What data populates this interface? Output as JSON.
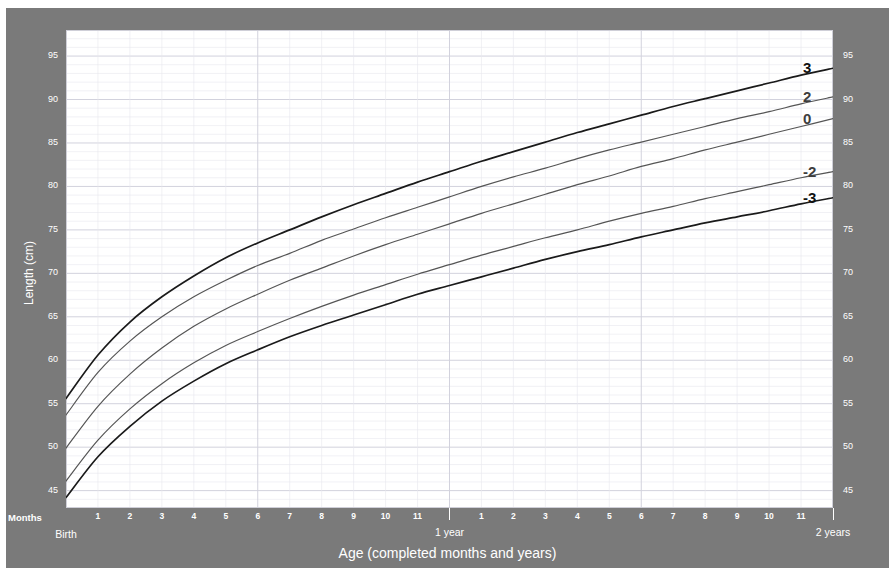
{
  "chart_data": {
    "type": "line",
    "title": "",
    "xlabel": "Age (completed months and years)",
    "ylabel": "Length (cm)",
    "xlim": [
      0,
      24
    ],
    "ylim": [
      43,
      98
    ],
    "grid": true,
    "legend_position": "right-inline",
    "x_unit": "months",
    "x": [
      0,
      1,
      2,
      3,
      4,
      5,
      6,
      7,
      8,
      9,
      10,
      11,
      12,
      13,
      14,
      15,
      16,
      17,
      18,
      19,
      20,
      21,
      22,
      23,
      24
    ],
    "series": [
      {
        "name": "3",
        "label": "3",
        "color": "#1a1a1a",
        "values": [
          55.6,
          60.6,
          64.4,
          67.3,
          69.7,
          71.8,
          73.5,
          75.0,
          76.5,
          77.9,
          79.2,
          80.5,
          81.7,
          82.9,
          84.0,
          85.1,
          86.2,
          87.2,
          88.2,
          89.2,
          90.1,
          91.0,
          91.9,
          92.8,
          93.6
        ]
      },
      {
        "name": "2",
        "label": "2",
        "color": "#555555",
        "values": [
          53.7,
          58.6,
          62.2,
          65.0,
          67.3,
          69.2,
          70.9,
          72.3,
          73.8,
          75.1,
          76.4,
          77.6,
          78.8,
          80.0,
          81.1,
          82.1,
          83.2,
          84.2,
          85.1,
          86.0,
          86.9,
          87.8,
          88.6,
          89.5,
          90.3
        ]
      },
      {
        "name": "0",
        "label": "0",
        "color": "#555555",
        "values": [
          49.9,
          54.7,
          58.4,
          61.4,
          63.9,
          65.9,
          67.6,
          69.2,
          70.6,
          72.0,
          73.3,
          74.5,
          75.7,
          76.9,
          78.0,
          79.1,
          80.2,
          81.2,
          82.3,
          83.2,
          84.2,
          85.1,
          86.0,
          86.9,
          87.8
        ]
      },
      {
        "name": "-2",
        "label": "-2",
        "color": "#555555",
        "values": [
          46.1,
          50.8,
          54.4,
          57.3,
          59.7,
          61.7,
          63.3,
          64.8,
          66.2,
          67.5,
          68.7,
          69.9,
          71.0,
          72.1,
          73.1,
          74.1,
          75.0,
          76.0,
          76.9,
          77.7,
          78.6,
          79.4,
          80.2,
          81.0,
          81.7
        ]
      },
      {
        "name": "-3",
        "label": "-3",
        "color": "#1a1a1a",
        "values": [
          44.2,
          48.9,
          52.4,
          55.3,
          57.6,
          59.6,
          61.2,
          62.7,
          64.0,
          65.2,
          66.4,
          67.6,
          68.6,
          69.6,
          70.6,
          71.6,
          72.5,
          73.3,
          74.2,
          75.0,
          75.8,
          76.5,
          77.2,
          78.0,
          78.7
        ]
      }
    ],
    "y_ticks": [
      45,
      50,
      55,
      60,
      65,
      70,
      75,
      80,
      85,
      90,
      95
    ],
    "y_minor_step": 1,
    "x_ticks_months": [
      1,
      2,
      3,
      4,
      5,
      6,
      7,
      8,
      9,
      10,
      11,
      13,
      14,
      15,
      16,
      17,
      18,
      19,
      20,
      21,
      22,
      23
    ],
    "x_tick_labels": [
      "1",
      "2",
      "3",
      "4",
      "5",
      "6",
      "7",
      "8",
      "9",
      "10",
      "11",
      "1",
      "2",
      "3",
      "4",
      "5",
      "6",
      "7",
      "8",
      "9",
      "10",
      "11"
    ],
    "epoch_ticks": [
      {
        "month": 0,
        "label": "Birth"
      },
      {
        "month": 12,
        "label": "1 year"
      },
      {
        "month": 24,
        "label": "2 years"
      }
    ],
    "axis_corner_label": "Months"
  },
  "axes": {
    "y_title": "Length (cm)",
    "x_title": "Age (completed months and years)",
    "corner_label": "Months",
    "left_ticks": [
      "95",
      "90",
      "85",
      "80",
      "75",
      "70",
      "65",
      "60",
      "55",
      "50",
      "45"
    ],
    "right_ticks": [
      "95",
      "90",
      "85",
      "80",
      "75",
      "70",
      "65",
      "60",
      "55",
      "50",
      "45"
    ],
    "month_labels": [
      "1",
      "2",
      "3",
      "4",
      "5",
      "6",
      "7",
      "8",
      "9",
      "10",
      "11",
      "1",
      "2",
      "3",
      "4",
      "5",
      "6",
      "7",
      "8",
      "9",
      "10",
      "11"
    ],
    "epochs": [
      "Birth",
      "1 year",
      "2 years"
    ]
  },
  "curve_labels": [
    {
      "text": "3",
      "bold": true
    },
    {
      "text": "2",
      "bold": false
    },
    {
      "text": "0",
      "bold": false
    },
    {
      "text": "-2",
      "bold": false
    },
    {
      "text": "-3",
      "bold": true
    }
  ],
  "colors": {
    "panel_background": "#7a7a7a",
    "plot_background": "#ffffff",
    "tick_text": "#ffffff",
    "outer_curve": "#1a1a1a",
    "inner_curve": "#555555",
    "grid_minor": "#e8e8ee",
    "grid_major": "#d2d2dd"
  }
}
